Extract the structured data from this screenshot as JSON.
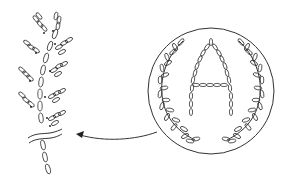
{
  "diagram": {
    "detail_view": {
      "name": "lazy-daisy-sprig",
      "position": "left"
    },
    "main_view": {
      "name": "monogram-medallion",
      "letter": "A",
      "frame": "circle",
      "ornament": "laurel-wreath"
    },
    "arrow": {
      "from": "monogram-medallion",
      "to": "lazy-daisy-sprig",
      "direction": "left"
    },
    "colors": {
      "stroke": "#333333",
      "background": "#ffffff"
    }
  }
}
